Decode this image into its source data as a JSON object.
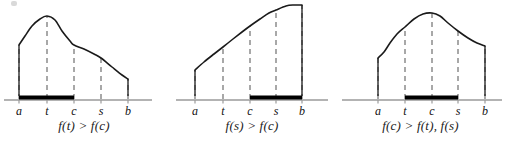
{
  "figure": {
    "title": "",
    "axis_color": "#9a9a9a",
    "curve_color": "#1a1a1a",
    "dash_color": "#8c8c8c",
    "bold_color": "#000000",
    "label_color": "#111111"
  },
  "panels": [
    {
      "id": "panel-0",
      "caption": "f(t) > f(c)",
      "ticks": [
        {
          "name": "a",
          "label": "a",
          "x": 19
        },
        {
          "name": "t",
          "label": "t",
          "x": 47
        },
        {
          "name": "c",
          "label": "c",
          "x": 74
        },
        {
          "name": "s",
          "label": "s",
          "x": 101
        },
        {
          "name": "b",
          "label": "b",
          "x": 128
        }
      ],
      "bold_interval": {
        "from": "a",
        "to": "c",
        "x1": 19,
        "x2": 74
      },
      "axis": {
        "x1": 4,
        "x2": 152,
        "y": 100
      },
      "curve_points": [
        [
          19,
          45
        ],
        [
          25,
          36
        ],
        [
          32,
          26
        ],
        [
          40,
          19
        ],
        [
          47,
          16
        ],
        [
          55,
          20
        ],
        [
          62,
          31
        ],
        [
          70,
          41
        ],
        [
          74,
          45
        ],
        [
          84,
          49
        ],
        [
          94,
          54
        ],
        [
          101,
          58
        ],
        [
          112,
          67
        ],
        [
          122,
          75
        ],
        [
          128,
          79
        ]
      ],
      "curve_drops": [
        {
          "x": 19,
          "y_top": 45
        },
        {
          "x": 128,
          "y_top": 79
        }
      ]
    },
    {
      "id": "panel-1",
      "caption": "f(s) > f(c)",
      "ticks": [
        {
          "name": "a",
          "label": "a",
          "x": 27
        },
        {
          "name": "t",
          "label": "t",
          "x": 55
        },
        {
          "name": "c",
          "label": "c",
          "x": 82
        },
        {
          "name": "s",
          "label": "s",
          "x": 108
        },
        {
          "name": "b",
          "label": "b",
          "x": 134
        }
      ],
      "bold_interval": {
        "from": "c",
        "to": "b",
        "x1": 82,
        "x2": 134
      },
      "axis": {
        "x1": 8,
        "x2": 160,
        "y": 100
      },
      "curve_points": [
        [
          27,
          70
        ],
        [
          36,
          62
        ],
        [
          46,
          54
        ],
        [
          55,
          47
        ],
        [
          65,
          39
        ],
        [
          74,
          32
        ],
        [
          82,
          26
        ],
        [
          92,
          19
        ],
        [
          101,
          13
        ],
        [
          108,
          10
        ],
        [
          118,
          6
        ],
        [
          126,
          5
        ],
        [
          134,
          5
        ]
      ],
      "curve_drops": [
        {
          "x": 27,
          "y_top": 70
        },
        {
          "x": 134,
          "y_top": 5
        }
      ]
    },
    {
      "id": "panel-2",
      "caption": "f(c) > f(t), f(s)",
      "ticks": [
        {
          "name": "a",
          "label": "a",
          "x": 42
        },
        {
          "name": "t",
          "label": "t",
          "x": 69
        },
        {
          "name": "c",
          "label": "c",
          "x": 96
        },
        {
          "name": "s",
          "label": "s",
          "x": 122
        },
        {
          "name": "b",
          "label": "b",
          "x": 149
        }
      ],
      "bold_interval": {
        "from": "t",
        "to": "s",
        "x1": 69,
        "x2": 122
      },
      "axis": {
        "x1": 6,
        "x2": 166,
        "y": 100
      },
      "curve_points": [
        [
          42,
          58
        ],
        [
          48,
          52
        ],
        [
          54,
          43
        ],
        [
          61,
          34
        ],
        [
          69,
          27
        ],
        [
          78,
          19
        ],
        [
          87,
          14
        ],
        [
          96,
          13
        ],
        [
          104,
          16
        ],
        [
          112,
          23
        ],
        [
          122,
          31
        ],
        [
          132,
          38
        ],
        [
          141,
          43
        ],
        [
          149,
          46
        ]
      ],
      "curve_drops": [
        {
          "x": 42,
          "y_top": 58
        },
        {
          "x": 149,
          "y_top": 46
        }
      ]
    }
  ]
}
